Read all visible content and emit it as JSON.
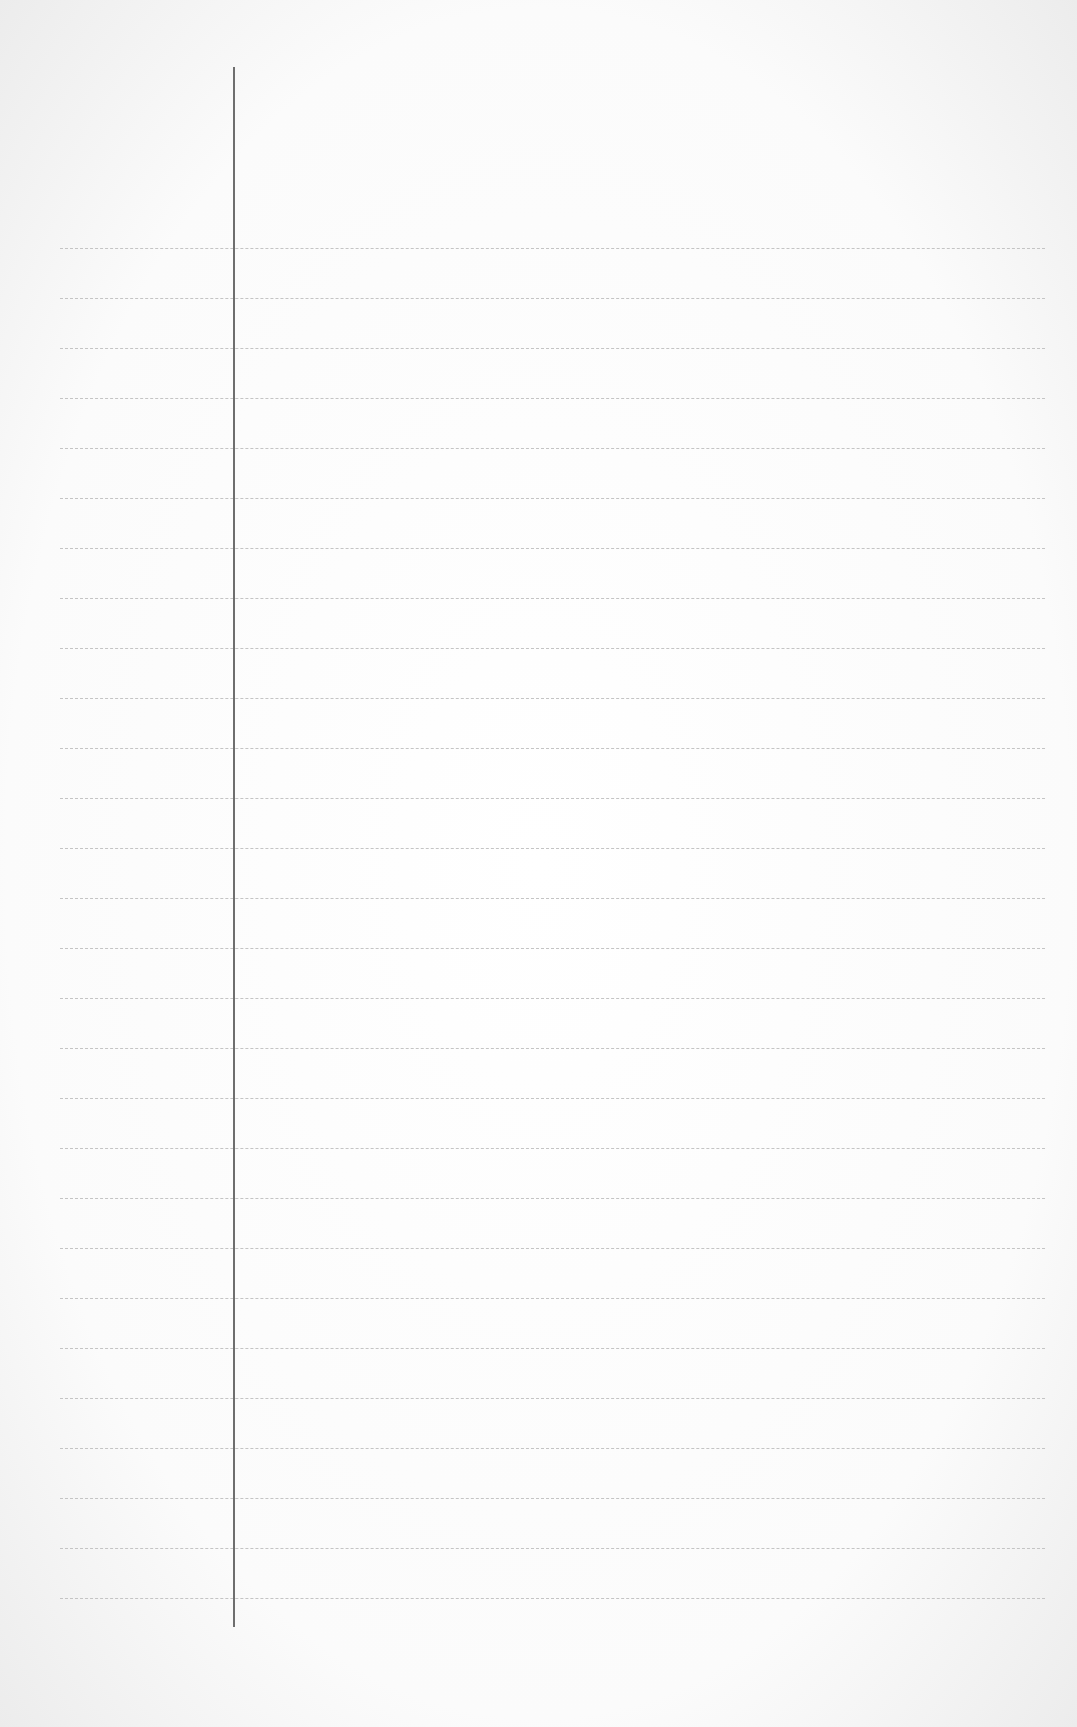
{
  "page": {
    "type": "lined-paper",
    "line_count": 28,
    "first_line_y": 248,
    "line_spacing": 50,
    "line_left": 60,
    "line_right": 1045,
    "margin_line_x": 233,
    "margin_line_top": 67,
    "margin_line_bottom": 1627,
    "colors": {
      "paper": "#ffffff",
      "rule": "#c4c4c4",
      "margin": "#6e6e6e"
    }
  }
}
